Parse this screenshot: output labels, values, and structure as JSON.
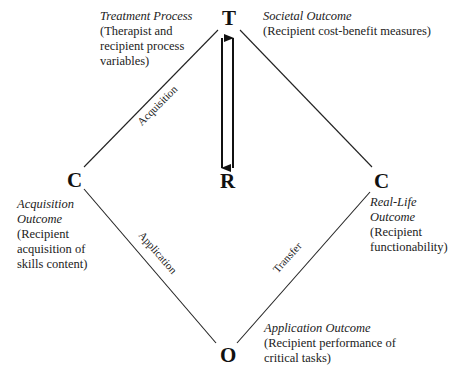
{
  "nodes": {
    "top": "T",
    "left": "C",
    "center": "R",
    "right": "C",
    "bottom": "O"
  },
  "edges": {
    "top_left": "Acquisition",
    "left_bottom": "Application",
    "right_bottom": "Transfer"
  },
  "annotations": {
    "treatment": {
      "title": "Treatment Process",
      "lines": [
        "(Therapist and",
        "recipient process",
        "variables)"
      ]
    },
    "societal": {
      "title": "Societal Outcome",
      "lines": [
        "(Recipient cost-benefit measures)"
      ]
    },
    "acquisition": {
      "title_lines": [
        "Acquisition",
        "Outcome"
      ],
      "lines": [
        "(Recipient",
        "acquisition of",
        "skills content)"
      ]
    },
    "real_life": {
      "title_lines": [
        "Real-Life",
        "Outcome"
      ],
      "lines": [
        "(Recipient",
        "functionability)"
      ]
    },
    "application": {
      "title": "Application Outcome",
      "lines": [
        "(Recipient performance of",
        "critical tasks)"
      ]
    }
  }
}
